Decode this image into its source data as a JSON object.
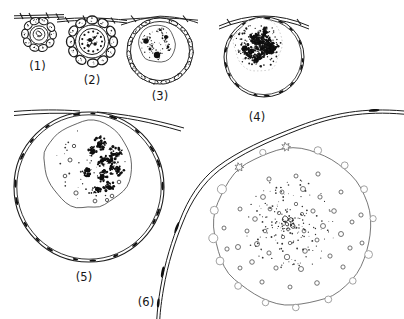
{
  "figure": {
    "kind": "line-art biology diagram",
    "ink_color": "#1c1c1c",
    "paper_color": "#ffffff",
    "stages": [
      {
        "id": "stage-1",
        "name": "small-follicle-with-coiled-nucleus",
        "label": "(1)"
      },
      {
        "id": "stage-2",
        "name": "follicle-with-dotted-nucleus",
        "label": "(2)"
      },
      {
        "id": "stage-3",
        "name": "growing-oocyte-speckled-nucleus",
        "label": "(3)"
      },
      {
        "id": "stage-4",
        "name": "oocyte-with-dense-dark-nucleus",
        "label": "(4)"
      },
      {
        "id": "stage-5",
        "name": "large-oocyte-germinal-vesicle",
        "label": "(5)"
      },
      {
        "id": "stage-6",
        "name": "mature-egg-with-yolk-vesicles",
        "label": "(6)"
      }
    ]
  }
}
